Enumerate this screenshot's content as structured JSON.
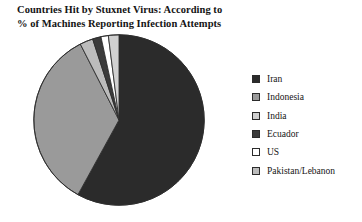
{
  "chart_data": {
    "type": "pie",
    "title": "Countries Hit by Stuxnet Virus: According to\n% of Machines Reporting Infection Attempts",
    "xlabel": "",
    "ylabel": "",
    "legend_position": "right",
    "grid": false,
    "start_angle_deg": 0,
    "direction": "clockwise",
    "unit": "%",
    "categories": [
      "Iran",
      "Indonesia",
      "India",
      "Ecuador",
      "US",
      "Pakistan/Lebanon"
    ],
    "values": [
      58.0,
      34.5,
      2.0,
      1.6,
      1.4,
      2.5
    ],
    "colors": [
      "#2b2b2b",
      "#9a9a9a",
      "#d0d0d0",
      "#3b3b3b",
      "#ffffff",
      "#bcbcbc"
    ],
    "slices": [
      {
        "label": "Iran",
        "value": 58.0,
        "color": "#2b2b2b"
      },
      {
        "label": "Indonesia",
        "value": 34.5,
        "color": "#9a9a9a"
      },
      {
        "label": "Pakistan/Lebanon",
        "value": 2.5,
        "color": "#bcbcbc"
      },
      {
        "label": "Ecuador",
        "value": 1.6,
        "color": "#3b3b3b"
      },
      {
        "label": "US",
        "value": 1.4,
        "color": "#ffffff"
      },
      {
        "label": "India",
        "value": 2.0,
        "color": "#d0d0d0"
      }
    ]
  },
  "legend": {
    "items": [
      {
        "label": "Iran",
        "color": "#2b2b2b"
      },
      {
        "label": "Indonesia",
        "color": "#9a9a9a"
      },
      {
        "label": "India",
        "color": "#d0d0d0"
      },
      {
        "label": "Ecuador",
        "color": "#3b3b3b"
      },
      {
        "label": "US",
        "color": "#ffffff"
      },
      {
        "label": "Pakistan/Lebanon",
        "color": "#bcbcbc"
      }
    ]
  }
}
